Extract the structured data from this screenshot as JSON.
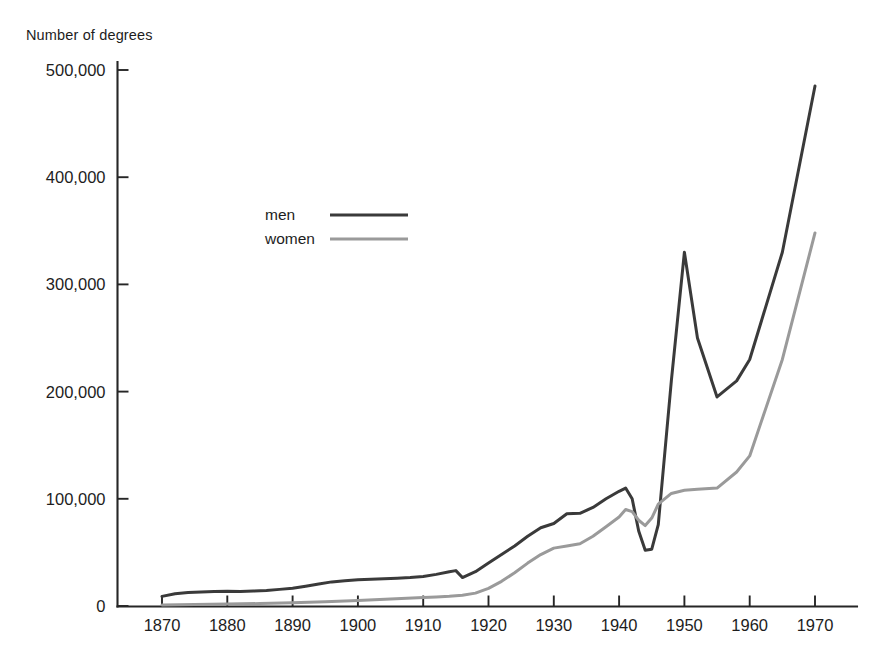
{
  "chart_data": {
    "type": "line",
    "title": "",
    "xlabel": "",
    "ylabel": "Number of degrees",
    "xlim": [
      1867,
      1975
    ],
    "ylim": [
      0,
      500000
    ],
    "grid": false,
    "legend_position": "upper-left-inside",
    "x_ticks": [
      "1870",
      "1880",
      "1890",
      "1900",
      "1910",
      "1920",
      "1930",
      "1940",
      "1950",
      "1960",
      "1970"
    ],
    "x_tick_values": [
      1870,
      1880,
      1890,
      1900,
      1910,
      1920,
      1930,
      1940,
      1950,
      1960,
      1970
    ],
    "y_ticks": [
      "0",
      "100,000",
      "200,000",
      "300,000",
      "400,000",
      "500,000"
    ],
    "y_tick_values": [
      0,
      100000,
      200000,
      300000,
      400000,
      500000
    ],
    "series": [
      {
        "name": "men",
        "color": "#3a3a3a",
        "x": [
          1870,
          1872,
          1874,
          1876,
          1878,
          1880,
          1882,
          1884,
          1886,
          1888,
          1890,
          1892,
          1894,
          1896,
          1898,
          1900,
          1902,
          1904,
          1906,
          1908,
          1910,
          1912,
          1914,
          1915,
          1916,
          1918,
          1920,
          1922,
          1924,
          1926,
          1928,
          1930,
          1932,
          1934,
          1936,
          1938,
          1940,
          1941,
          1942,
          1943,
          1944,
          1945,
          1946,
          1948,
          1950,
          1952,
          1955,
          1958,
          1960,
          1965,
          1970
        ],
        "y": [
          9000,
          11500,
          12500,
          13000,
          13500,
          13800,
          13500,
          14000,
          14500,
          15500,
          16500,
          18500,
          20500,
          22500,
          23500,
          24500,
          25000,
          25500,
          26000,
          26500,
          27500,
          29500,
          32000,
          33000,
          26500,
          32000,
          40000,
          48000,
          56000,
          65000,
          73000,
          77000,
          86000,
          86500,
          92000,
          100000,
          107000,
          110000,
          100000,
          70000,
          52000,
          53000,
          76000,
          210000,
          330000,
          250000,
          195000,
          210000,
          230000,
          330000,
          485000
        ]
      },
      {
        "name": "women",
        "color": "#9a9a9a",
        "x": [
          1870,
          1875,
          1880,
          1885,
          1890,
          1895,
          1900,
          1905,
          1910,
          1912,
          1914,
          1916,
          1918,
          1920,
          1922,
          1924,
          1926,
          1928,
          1930,
          1932,
          1934,
          1936,
          1938,
          1940,
          1941,
          1942,
          1943,
          1944,
          1945,
          1946,
          1948,
          1950,
          1952,
          1955,
          1958,
          1960,
          1965,
          1970
        ],
        "y": [
          1000,
          1300,
          1800,
          2300,
          3000,
          4000,
          5200,
          6500,
          8000,
          8500,
          9000,
          10000,
          12000,
          16500,
          23000,
          31000,
          40000,
          48000,
          54000,
          56000,
          58000,
          65000,
          74000,
          83000,
          90000,
          88000,
          80000,
          75000,
          82000,
          95000,
          105000,
          108000,
          109000,
          110000,
          125000,
          140000,
          230000,
          348000
        ]
      }
    ],
    "legend": [
      {
        "label": "men",
        "color": "#3a3a3a"
      },
      {
        "label": "women",
        "color": "#9a9a9a"
      }
    ],
    "annotations": []
  },
  "colors": {
    "men_line": "#3a3a3a",
    "women_line": "#9a9a9a",
    "axis": "#262626",
    "text": "#1d1d1d",
    "background": "#ffffff"
  }
}
